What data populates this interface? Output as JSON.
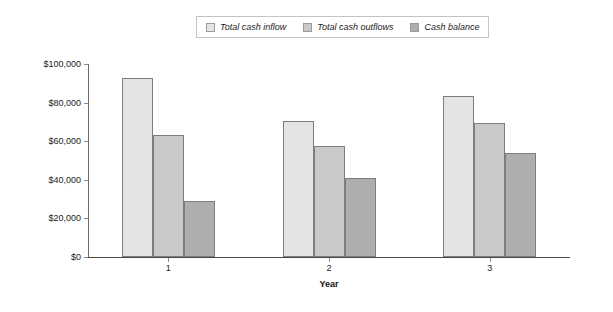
{
  "chart_data": {
    "type": "bar",
    "title": "",
    "xlabel": "Year",
    "ylabel": "",
    "categories": [
      "1",
      "2",
      "3"
    ],
    "series": [
      {
        "name": "Total cash inflow",
        "color": "#e4e4e4",
        "values": [
          93000,
          70500,
          83500
        ]
      },
      {
        "name": "Total cash outflows",
        "color": "#c9c9c9",
        "values": [
          63000,
          57500,
          69500
        ]
      },
      {
        "name": "Cash balance",
        "color": "#aeaeae",
        "values": [
          29000,
          41000,
          54000
        ]
      }
    ],
    "ylim": [
      0,
      100000
    ],
    "ytick_values": [
      0,
      20000,
      40000,
      60000,
      80000,
      100000
    ],
    "ytick_labels": [
      "$0",
      "$20,000",
      "$40,000",
      "$60,000",
      "$80,000",
      "$100,000"
    ],
    "grid": false,
    "legend_position": "top-center"
  },
  "legend": {
    "entries": [
      {
        "label": "Total cash inflow"
      },
      {
        "label": "Total cash outflows"
      },
      {
        "label": "Cash balance"
      }
    ]
  },
  "axes": {
    "x_title": "Year",
    "y_ticks": [
      {
        "label": "$100,000"
      },
      {
        "label": "$80,000"
      },
      {
        "label": "$60,000"
      },
      {
        "label": "$40,000"
      },
      {
        "label": "$20,000"
      },
      {
        "label": "$0"
      }
    ],
    "x_ticks": [
      {
        "label": "1"
      },
      {
        "label": "2"
      },
      {
        "label": "3"
      }
    ]
  }
}
